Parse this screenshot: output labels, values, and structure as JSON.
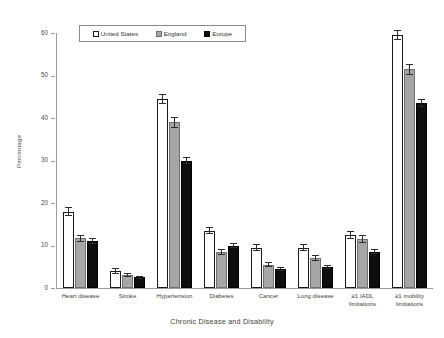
{
  "chart_data": {
    "type": "bar",
    "title": "",
    "xlabel": "Chronic Disease and Disability",
    "ylabel": "Percentage",
    "ylim": [
      0,
      60
    ],
    "yticks": [
      0,
      10,
      20,
      30,
      40,
      50,
      60
    ],
    "grid": false,
    "legend_position": "top-center",
    "categories": [
      "Heart disease",
      "Stroke",
      "Hypertension",
      "Diabetes",
      "Cancer",
      "Lung disease",
      "≥1 IADL\nlimitations",
      "≥1 mobility\nlimitations"
    ],
    "series": [
      {
        "name": "United States",
        "color": "#ffffff",
        "values": [
          18.0,
          4.0,
          44.5,
          13.5,
          9.5,
          9.5,
          12.5,
          59.5
        ],
        "errors": [
          1.0,
          0.6,
          1.2,
          0.9,
          0.8,
          0.8,
          0.9,
          1.2
        ]
      },
      {
        "name": "England",
        "color": "#a6a6a6",
        "values": [
          11.7,
          3.0,
          39.0,
          8.5,
          5.5,
          7.0,
          11.5,
          51.5
        ],
        "errors": [
          0.8,
          0.5,
          1.3,
          0.7,
          0.6,
          0.7,
          0.9,
          1.3
        ]
      },
      {
        "name": "Europe",
        "color": "#0d0d0d",
        "values": [
          11.0,
          2.5,
          30.0,
          10.0,
          4.5,
          5.0,
          8.5,
          43.5
        ],
        "errors": [
          0.7,
          0.4,
          0.9,
          0.6,
          0.4,
          0.5,
          0.6,
          0.9
        ]
      }
    ]
  },
  "legend": {
    "items": [
      {
        "label": "United States",
        "key": "us"
      },
      {
        "label": "England",
        "key": "en"
      },
      {
        "label": "Europe",
        "key": "eu"
      }
    ]
  }
}
